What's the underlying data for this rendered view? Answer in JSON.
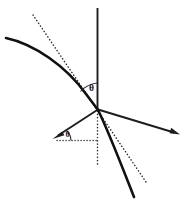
{
  "figure": {
    "type": "geometry-diagram",
    "background_color": "#ffffff",
    "stroke_color": "#1a1a1a",
    "labels": {
      "angle_upper": "θ",
      "angle_lower": "θ"
    },
    "elements": {
      "vertical_axis": {
        "name": "vertical-axis",
        "description": "solid vertical line through origin going up",
        "x": 97.5,
        "y_top": 8,
        "y_bottom": 109
      },
      "vertical_dotted": {
        "name": "vertical-dotted-line",
        "description": "dotted vertical line below origin",
        "x": 97.5,
        "y_top": 110,
        "y_bottom": 164
      },
      "horizontal_dotted": {
        "name": "horizontal-dotted-line",
        "description": "dotted horizontal line from arrow tail to below origin",
        "y": 140,
        "x_left": 57,
        "x_right": 97.5
      },
      "right_ray": {
        "name": "right-ray-arrow",
        "description": "solid ray from origin to lower right with arrowhead",
        "from": [
          98,
          109
        ],
        "to": [
          180,
          134
        ]
      },
      "left_ray": {
        "name": "left-ray-arrow",
        "description": "solid ray from origin to lower left with arrowhead",
        "from": [
          98,
          109
        ],
        "to": [
          53,
          138
        ]
      },
      "curve": {
        "name": "concave-curve",
        "description": "thick curve from upper left through origin down to lower right",
        "start": [
          6,
          38
        ],
        "through": [
          98,
          109
        ],
        "end": [
          134,
          197
        ]
      },
      "tangent_dotted": {
        "name": "tangent-dotted-line",
        "description": "dotted straight tangent line touching curve near origin",
        "start": [
          33,
          15
        ],
        "end": [
          146,
          182
        ]
      },
      "angle_arc_upper": {
        "name": "angle-arc-upper",
        "description": "arc between vertical axis and curve above origin",
        "center": [
          97.5,
          109
        ],
        "radius": 26
      },
      "angle_arc_lower": {
        "name": "angle-arc-lower",
        "description": "arc between horizontal dotted line and left ray",
        "center": [
          57,
          140
        ],
        "radius": 13
      }
    },
    "label_positions": {
      "theta_upper": [
        92,
        87
      ],
      "theta_lower": [
        68,
        135
      ]
    }
  }
}
